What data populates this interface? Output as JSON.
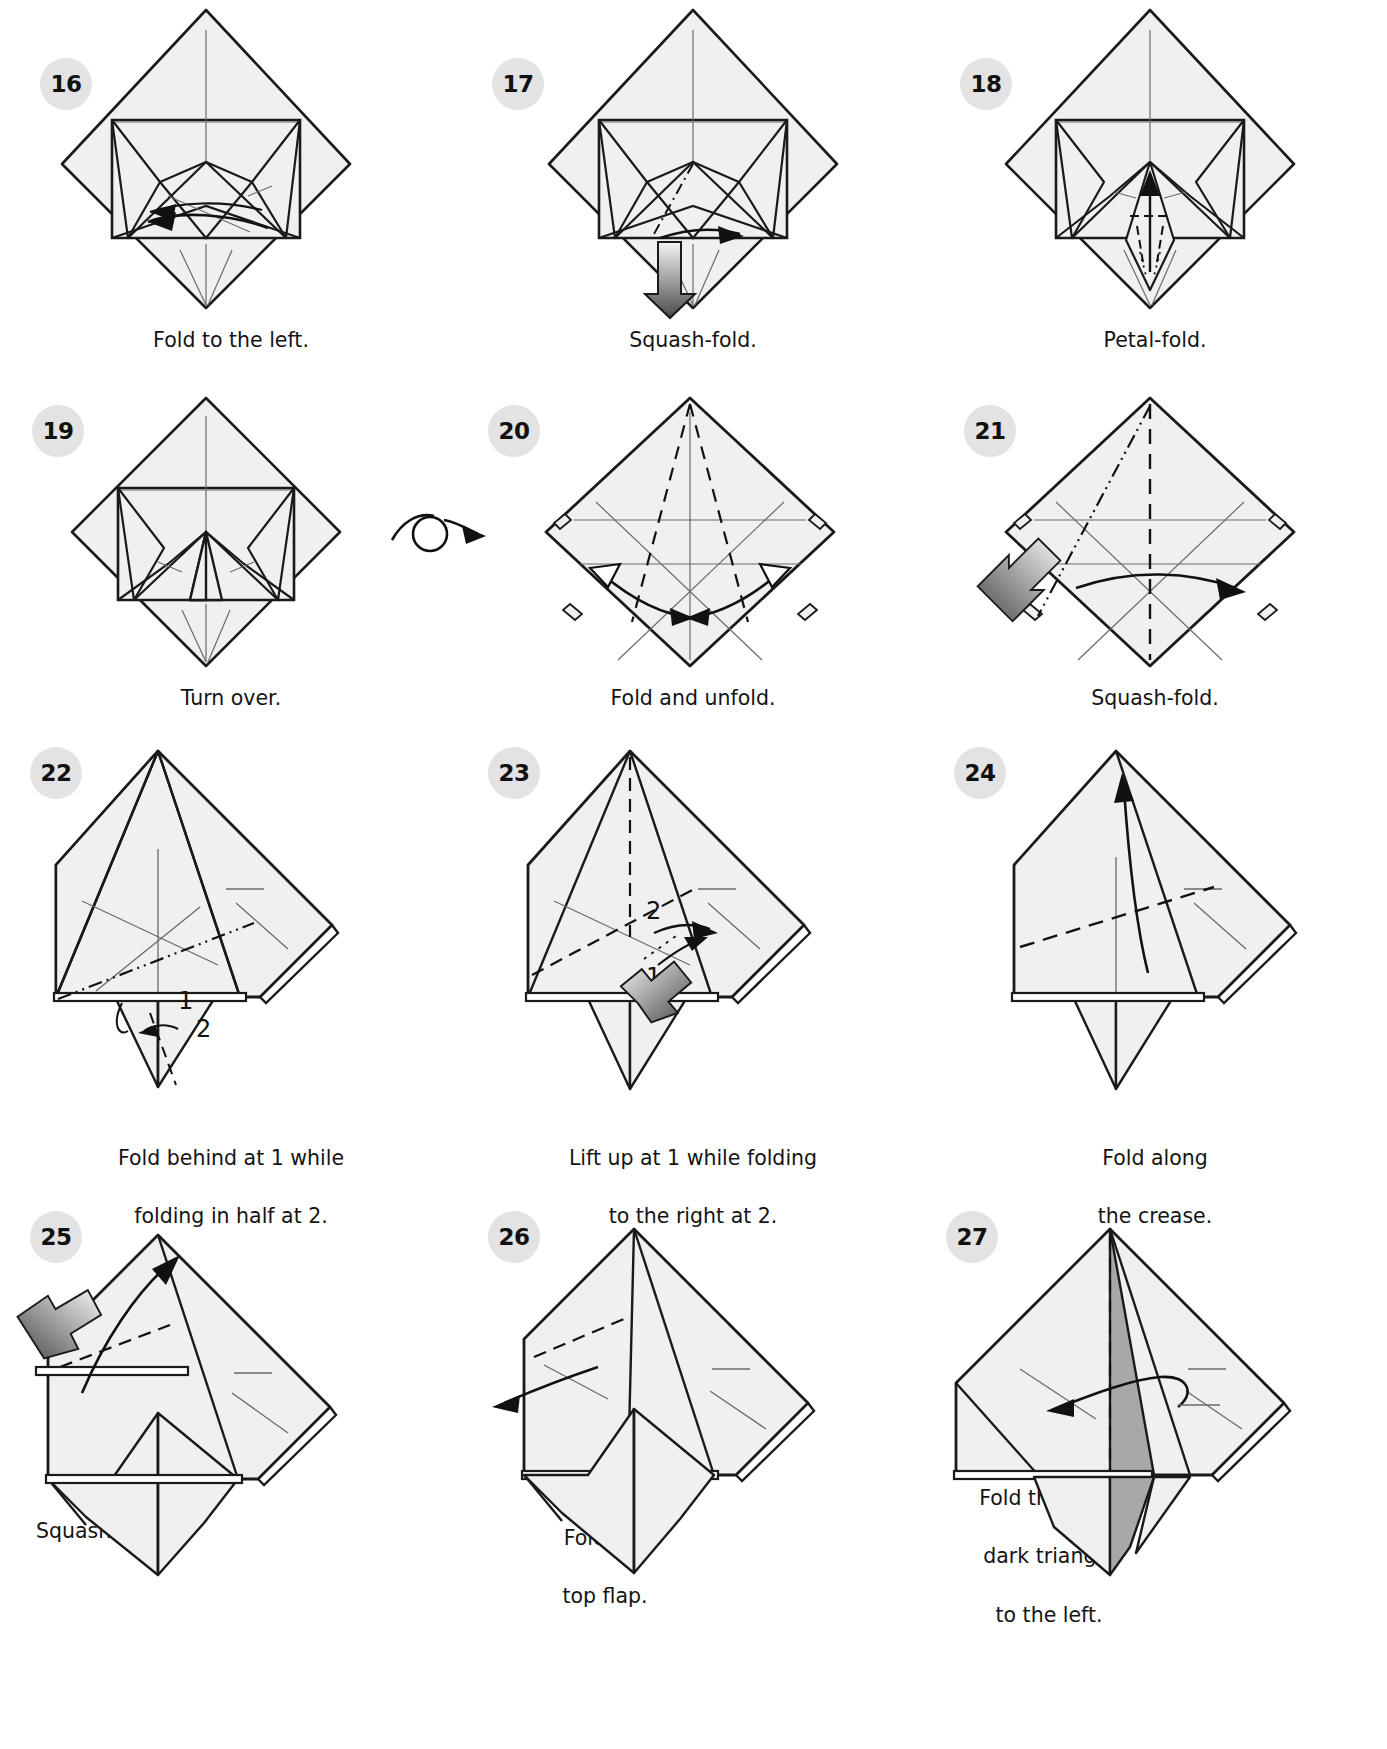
{
  "page": {
    "columns": 3,
    "rows": 4
  },
  "palette": {
    "paper_front": "#f0f0f0",
    "paper_back": "#a8a8a8",
    "line": "#1a1a1a",
    "thin_line": "#555555",
    "badge_bg": "#e3e3e3",
    "badge_text": "#111111",
    "arrow_fill_light": "#f2f2f2",
    "arrow_fill_dark": "#4a4a4a",
    "text": "#141414"
  },
  "legend": {
    "valley_fold": "dashed line",
    "mountain_fold": "dash-dot-dot line",
    "existing_crease": "thin solid line",
    "push_arrow": "gradient filled block arrow",
    "turn_over": "loop arrow with circle"
  },
  "steps": [
    {
      "number": "16",
      "caption": "Fold to the left.",
      "caption_lines": [
        "Fold to the left."
      ],
      "figure": "diamond-with-inner-flaps",
      "annotations": [],
      "has_push_arrow": false,
      "has_turn_over": false
    },
    {
      "number": "17",
      "caption": "Squash-fold.",
      "caption_lines": [
        "Squash-fold."
      ],
      "figure": "diamond-with-squash-crease",
      "annotations": [],
      "has_push_arrow": true,
      "has_turn_over": false
    },
    {
      "number": "18",
      "caption": "Petal-fold.",
      "caption_lines": [
        "Petal-fold."
      ],
      "figure": "diamond-with-petal-spike",
      "annotations": [],
      "has_push_arrow": false,
      "has_turn_over": false
    },
    {
      "number": "19",
      "caption": "Turn over.",
      "caption_lines": [
        "Turn over."
      ],
      "figure": "diamond-completed-petal",
      "annotations": [],
      "has_push_arrow": false,
      "has_turn_over": true
    },
    {
      "number": "20",
      "caption": "Fold and unfold.",
      "caption_lines": [
        "Fold and unfold."
      ],
      "figure": "diamond-valley-creases-both-sides",
      "annotations": [],
      "has_push_arrow": false,
      "has_turn_over": false
    },
    {
      "number": "21",
      "caption": "Squash-fold.",
      "caption_lines": [
        "Squash-fold."
      ],
      "figure": "diamond-with-center-valley",
      "annotations": [],
      "has_push_arrow": true,
      "has_turn_over": false
    },
    {
      "number": "22",
      "caption": "Fold behind at 1 while folding in half at 2.",
      "caption_lines": [
        "Fold behind at 1 while",
        "folding in half at 2."
      ],
      "figure": "pentagon-body-with-tail",
      "annotations": [
        "1",
        "2"
      ],
      "has_push_arrow": false,
      "has_turn_over": false
    },
    {
      "number": "23",
      "caption": "Lift up at 1 while folding to the right at 2.",
      "caption_lines": [
        "Lift up at 1 while folding",
        "to the right at 2."
      ],
      "figure": "body-with-lift-creases",
      "annotations": [
        "1",
        "2"
      ],
      "has_push_arrow": true,
      "has_turn_over": false
    },
    {
      "number": "24",
      "caption": "Fold along the crease.",
      "caption_lines": [
        "Fold along",
        "the crease."
      ],
      "figure": "body-with-diagonal-crease",
      "annotations": [],
      "has_push_arrow": false,
      "has_turn_over": false
    },
    {
      "number": "25",
      "caption": "Squash-fold.",
      "caption_lines": [
        "Squash-fold."
      ],
      "figure": "body-head-squash",
      "annotations": [],
      "has_push_arrow": true,
      "has_turn_over": false
    },
    {
      "number": "26",
      "caption": "Fold the top flap.",
      "caption_lines": [
        "Fold the",
        "top flap."
      ],
      "figure": "body-with-top-flap",
      "annotations": [],
      "has_push_arrow": false,
      "has_turn_over": false
    },
    {
      "number": "27",
      "caption": "Fold the long, dark triangle to the left.",
      "caption_lines": [
        "Fold the long,",
        "dark triangle",
        "to the left."
      ],
      "figure": "body-with-dark-triangle",
      "annotations": [],
      "has_push_arrow": false,
      "has_turn_over": false
    }
  ]
}
